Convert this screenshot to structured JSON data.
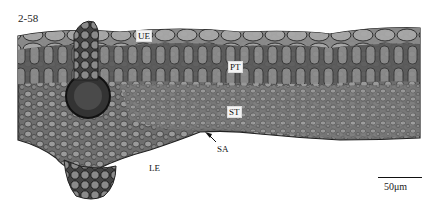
{
  "figure": {
    "number": "2-58",
    "labels": {
      "upper_epidermis": "UE",
      "palisade_tissue": "PT",
      "spongy_tissue": "ST",
      "stomatal_apparatus": "SA",
      "lower_epidermis": "LE"
    },
    "scale_bar": "50μm"
  }
}
